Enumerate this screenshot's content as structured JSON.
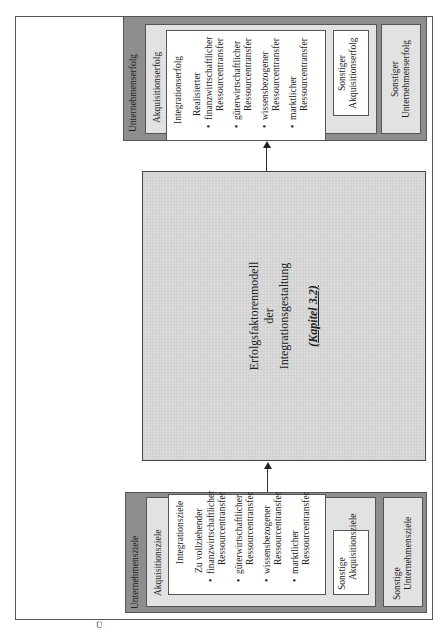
{
  "left_box": {
    "outer_label": "Unternehmensziele",
    "acq_label": "Akquisitionsziele",
    "integration": {
      "title": "Integrationsziele",
      "subtitle": "Zu vollziehender",
      "items": [
        {
          "line1": "finanzwirtschaftlicher",
          "line2": "Ressourcentransfer"
        },
        {
          "line1": "güterwirtschaftlicher",
          "line2": "Ressourcentransfer"
        },
        {
          "line1": "wissensbezogener",
          "line2": "Ressourcentransfer"
        },
        {
          "line1": "marktlicher",
          "line2": "Ressourcentransfer"
        }
      ]
    },
    "other_acq": {
      "line1": "Sonstige",
      "line2": "Akquisitionsziele"
    },
    "other_company": {
      "line1": "Sonstige",
      "line2": "Unternehmensziele"
    }
  },
  "center_box": {
    "line1": "Erfolgsfaktorenmodell",
    "line2": "der",
    "line3": "Integrationsgestaltung",
    "reference": "(Kapitel 3.2)"
  },
  "right_box": {
    "outer_label": "Unternehmenserfolg",
    "acq_label": "Akquisitionserfolg",
    "integration": {
      "title": "Integrationserfolg",
      "subtitle": "Realisierter",
      "items": [
        {
          "line1": "finanzwirtschaftlicher",
          "line2": "Ressourcentransfer"
        },
        {
          "line1": "güterwirtschaftlicher",
          "line2": "Ressourcentransfer"
        },
        {
          "line1": "wissensbezogener",
          "line2": "Ressourcentransfer"
        },
        {
          "line1": "marktlicher",
          "line2": "Ressourcentransfer"
        }
      ]
    },
    "other_acq": {
      "line1": "Sonstiger",
      "line2": "Akquisitionserfolg"
    },
    "other_company": {
      "line1": "Sonstiger",
      "line2": "Unternehmenserfolg"
    }
  },
  "bullet": "•",
  "caption_fragment": "Ü"
}
